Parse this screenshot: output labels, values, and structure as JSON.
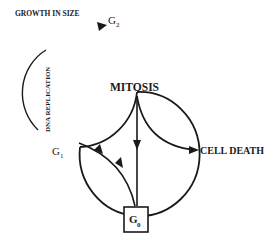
{
  "diagram": {
    "type": "cell-cycle",
    "labels": {
      "growth": "GROWTH IN SIZE",
      "g2": "G",
      "g2_sub": "2",
      "dna": "DNA REPLICATION",
      "mitosis": "MITOSIS",
      "cell_death": "CELL DEATH",
      "g1": "G",
      "g1_sub": "1",
      "g0": "G",
      "g0_sub": "0"
    },
    "colors": {
      "stroke": "#1a1a1a",
      "background": "#ffffff"
    }
  }
}
